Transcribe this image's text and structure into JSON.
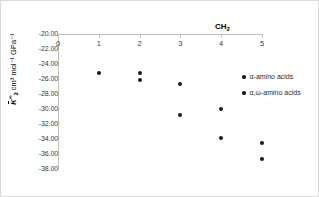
{
  "chart_data": {
    "type": "scatter",
    "title": "",
    "xlabel": "CH2",
    "xlabel_display": "CH",
    "xlabel_sub": "2",
    "ylabel": "K2(inf) cm3 mol-1 GPa-1",
    "ylabel_symbol": "K",
    "ylabel_sup": "∞",
    "ylabel_sub": "2",
    "ylabel_unit": " cm³ mol⁻¹ GPa⁻¹",
    "xlim": [
      0,
      5
    ],
    "ylim": [
      -38,
      -20
    ],
    "y_inverted": true,
    "grid": false,
    "legend_position": "right",
    "xticks": [
      "0",
      "1",
      "2",
      "3",
      "4",
      "5"
    ],
    "xtick_values": [
      0,
      1,
      2,
      3,
      4,
      5
    ],
    "yticks": [
      "-20.00",
      "-22.00",
      "-24.00",
      "-26.00",
      "-28.00",
      "-30.00",
      "-32.00",
      "-34.00",
      "-36.00",
      "-38.00"
    ],
    "ytick_values": [
      -20,
      -22,
      -24,
      -26,
      -28,
      -30,
      -32,
      -34,
      -36,
      -38
    ],
    "series": [
      {
        "name": "α-amino acids",
        "marker": "circle",
        "color": "#1a1a1a",
        "points": [
          {
            "x": 1,
            "y": -25.2
          },
          {
            "x": 2,
            "y": -25.2
          },
          {
            "x": 3,
            "y": -26.6
          },
          {
            "x": 4,
            "y": -30.0
          },
          {
            "x": 5,
            "y": -34.5
          }
        ]
      },
      {
        "name": "α,ω-amino acids",
        "marker": "circle",
        "color": "#1a1a1a",
        "points": [
          {
            "x": 2,
            "y": -26.1
          },
          {
            "x": 3,
            "y": -30.8
          },
          {
            "x": 4,
            "y": -33.8
          },
          {
            "x": 5,
            "y": -36.7
          }
        ]
      }
    ]
  },
  "legend": {
    "items": [
      {
        "label": "α-amino acids"
      },
      {
        "label": "α,ω-amino acids"
      }
    ]
  },
  "colors": {
    "marker": "#1a1a1a",
    "axis": "#bfbfbf",
    "border": "#d9d9d9",
    "text": "#3a3a3a",
    "background": "#ffffff"
  }
}
